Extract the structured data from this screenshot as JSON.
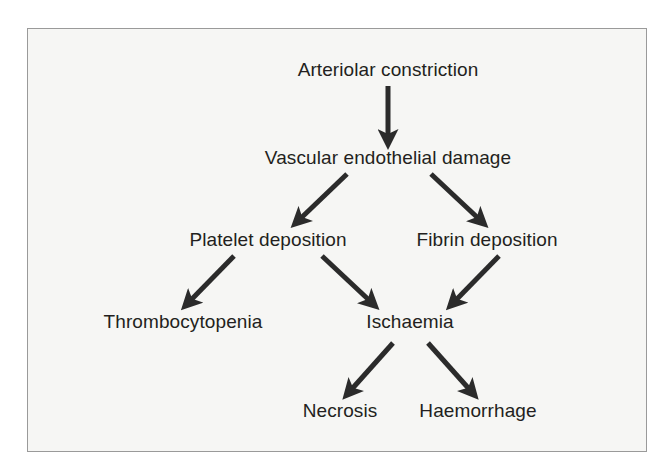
{
  "figure": {
    "type": "flowchart",
    "title": "",
    "background_color": "#f6f6f4",
    "border_color": "#9a9a9a",
    "text_color": "#231f20",
    "arrow_color": "#2b2b2b"
  },
  "nodes": [
    {
      "id": "arteriolar-constriction",
      "label": "Arteriolar constriction",
      "x": 388,
      "y": 70,
      "level": 1
    },
    {
      "id": "vascular-endothelial-damage",
      "label": "Vascular endothelial damage",
      "x": 388,
      "y": 158,
      "level": 2
    },
    {
      "id": "platelet-deposition",
      "label": "Platelet deposition",
      "x": 268,
      "y": 240,
      "level": 3
    },
    {
      "id": "fibrin-deposition",
      "label": "Fibrin deposition",
      "x": 487,
      "y": 240,
      "level": 3
    },
    {
      "id": "thrombocytopenia",
      "label": "Thrombocytopenia",
      "x": 183,
      "y": 322,
      "level": 4
    },
    {
      "id": "ischaemia",
      "label": "Ischaemia",
      "x": 410,
      "y": 322,
      "level": 4
    },
    {
      "id": "necrosis",
      "label": "Necrosis",
      "x": 340,
      "y": 411,
      "level": 5
    },
    {
      "id": "haemorrhage",
      "label": "Haemorrhage",
      "x": 478,
      "y": 411,
      "level": 5
    }
  ],
  "edges": [
    {
      "id": "edge-constriction-to-damage",
      "from": "arteriolar-constriction",
      "to": "vascular-endothelial-damage",
      "x1": 388,
      "y1": 86,
      "x2": 388,
      "y2": 137
    },
    {
      "id": "edge-damage-to-platelet",
      "from": "vascular-endothelial-damage",
      "to": "platelet-deposition",
      "x1": 347,
      "y1": 174,
      "x2": 300,
      "y2": 219
    },
    {
      "id": "edge-damage-to-fibrin",
      "from": "vascular-endothelial-damage",
      "to": "fibrin-deposition",
      "x1": 431,
      "y1": 174,
      "x2": 479,
      "y2": 219
    },
    {
      "id": "edge-platelet-to-thrombocytopenia",
      "from": "platelet-deposition",
      "to": "thrombocytopenia",
      "x1": 234,
      "y1": 256,
      "x2": 190,
      "y2": 301
    },
    {
      "id": "edge-platelet-to-ischaemia",
      "from": "platelet-deposition",
      "to": "ischaemia",
      "x1": 322,
      "y1": 256,
      "x2": 370,
      "y2": 301
    },
    {
      "id": "edge-fibrin-to-ischaemia",
      "from": "fibrin-deposition",
      "to": "ischaemia",
      "x1": 499,
      "y1": 256,
      "x2": 455,
      "y2": 301
    },
    {
      "id": "edge-ischaemia-to-necrosis",
      "from": "ischaemia",
      "to": "necrosis",
      "x1": 393,
      "y1": 343,
      "x2": 351,
      "y2": 390
    },
    {
      "id": "edge-ischaemia-to-haemorrhage",
      "from": "ischaemia",
      "to": "haemorrhage",
      "x1": 428,
      "y1": 343,
      "x2": 470,
      "y2": 390
    }
  ]
}
